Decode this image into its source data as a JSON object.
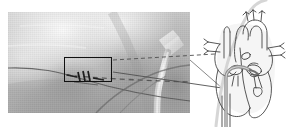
{
  "figure": {
    "kind": "medical-illustration",
    "background_color": "#ffffff",
    "width": 286,
    "height": 127
  },
  "fluoroscopy": {
    "name": "fluoroscopy-panel",
    "modality": "fluoroscopy",
    "tone": "grayscale",
    "frame": {
      "x": 8,
      "y": 12,
      "width": 182,
      "height": 101
    },
    "background_color": "#b9b9b9",
    "instruments": [
      {
        "name": "guidewire",
        "style": "thin dark line",
        "color": "#4a4a4a"
      },
      {
        "name": "delivery-catheter-shaft",
        "style": "bright radiopaque tube",
        "color": "#e8e8e8"
      },
      {
        "name": "secondary-catheter",
        "style": "curved dark line",
        "color": "#5a5a5a"
      },
      {
        "name": "sheath",
        "style": "tapered bright tube",
        "color": "#dcdcdc"
      }
    ]
  },
  "roi": {
    "name": "region-of-interest-box",
    "label": "",
    "border_color": "#111111",
    "border_width_px": 1.4,
    "rect": {
      "x": 64,
      "y": 57,
      "width": 48,
      "height": 25
    },
    "contents": {
      "device_name": "radiopaque-device-markers",
      "marker_count": 3,
      "marker_color": "#1c1c1c",
      "orientation": "oblique"
    }
  },
  "callout_lines": [
    {
      "name": "callout-dashed-upper",
      "style": "dashed",
      "color": "#4f4f4f",
      "width_px": 0.9
    },
    {
      "name": "callout-solid-lower",
      "style": "solid",
      "color": "#4f4f4f",
      "width_px": 0.9
    }
  ],
  "heart_diagram": {
    "name": "heart-anatomy-diagram",
    "style": "line-art cross-section",
    "stroke_color": "#3a3a3a",
    "fill_color": "#ffffff",
    "shading_color": "#d8d8d8",
    "frame": {
      "x": 196,
      "y": 0,
      "width": 90,
      "height": 127
    },
    "structures": [
      "aortic-arch",
      "superior-vena-cava",
      "pulmonary-artery",
      "right-atrium",
      "right-ventricle",
      "left-atrium",
      "left-ventricle",
      "mitral-valve",
      "tricuspid-valve",
      "interatrial-septum",
      "inferior-vena-cava",
      "pulmonary-veins"
    ],
    "catheter": {
      "name": "transseptal-catheter",
      "entry": "inferior-vena-cava",
      "target": "mitral-valve",
      "color": "#9a9a9a"
    },
    "guide_curve": {
      "name": "guide-wire-curve",
      "color": "#cfcfcf"
    }
  }
}
